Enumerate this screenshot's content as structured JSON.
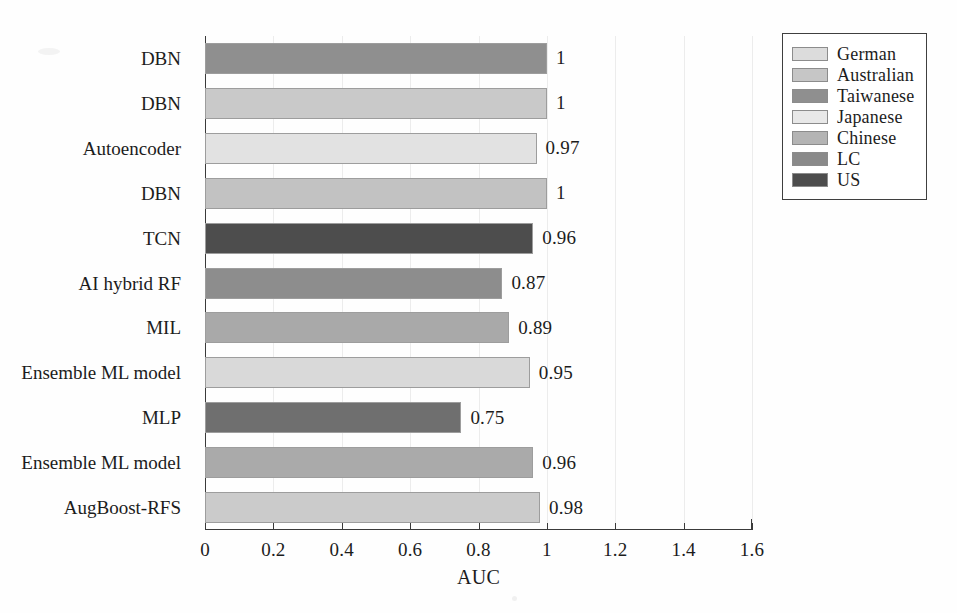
{
  "chart_data": {
    "type": "bar",
    "orientation": "horizontal",
    "title": "",
    "xlabel": "AUC",
    "ylabel": "",
    "xlim": [
      0,
      1.6
    ],
    "ylim": null,
    "grid": true,
    "grid_axis": "x",
    "legend_position": "upper right",
    "xticks": [
      "0",
      "0.2",
      "0.4",
      "0.6",
      "0.8",
      "1",
      "1.2",
      "1.4",
      "1.6"
    ],
    "xtick_values": [
      0,
      0.2,
      0.4,
      0.6,
      0.8,
      1.0,
      1.2,
      1.4,
      1.6
    ],
    "categories": [
      "DBN",
      "DBN",
      "Autoencoder",
      "DBN",
      "TCN",
      "AI hybrid RF",
      "MIL",
      "Ensemble ML model",
      "MLP",
      "Ensemble ML model",
      "AugBoost-RFS"
    ],
    "values": [
      1,
      1,
      0.97,
      1,
      0.96,
      0.87,
      0.89,
      0.95,
      0.75,
      0.96,
      0.98
    ],
    "value_labels": [
      "1",
      "1",
      "0.97",
      "1",
      "0.96",
      "0.87",
      "0.89",
      "0.95",
      "0.75",
      "0.96",
      "0.98"
    ],
    "bar_groups": [
      "Taiwanese",
      "Chinese",
      "Japanese",
      "Chinese",
      "US",
      "Taiwanese",
      "Australian",
      "Japanese",
      "LC",
      "Australian",
      "Chinese"
    ],
    "bar_colors": [
      "#8f8f8f",
      "#c9c9c9",
      "#e2e2e2",
      "#c2c2c2",
      "#4d4d4d",
      "#8d8d8d",
      "#a9a9a9",
      "#d9d9d9",
      "#6f6f6f",
      "#aaaaaa",
      "#cbcbcb"
    ],
    "legend": [
      {
        "label": "German",
        "color": "#dcdcdc"
      },
      {
        "label": "Australian",
        "color": "#c6c6c6"
      },
      {
        "label": "Taiwanese",
        "color": "#8f8f8f"
      },
      {
        "label": "Japanese",
        "color": "#e8e8e8"
      },
      {
        "label": "Chinese",
        "color": "#b4b4b4"
      },
      {
        "label": "LC",
        "color": "#8a8a8a"
      },
      {
        "label": "US",
        "color": "#4d4d4d"
      }
    ]
  },
  "axis": {
    "x_title": "AUC"
  }
}
